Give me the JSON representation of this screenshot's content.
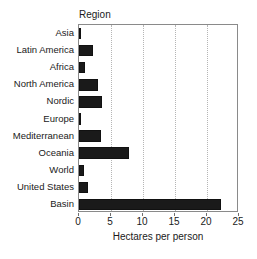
{
  "chart_data": {
    "type": "bar",
    "orientation": "horizontal",
    "title": "",
    "group_header": "Region",
    "xlabel": "Hectares per person",
    "ylabel": "",
    "xlim": [
      0,
      25
    ],
    "xticks": [
      0,
      5,
      10,
      15,
      20,
      25
    ],
    "xtick_labels": [
      "0",
      "5",
      "10",
      "15",
      "20",
      "25"
    ],
    "gridlines": [
      5,
      10,
      15,
      20
    ],
    "grid": true,
    "legend": null,
    "bar_color": "#1a1a1a",
    "categories": [
      "Asia",
      "Latin America",
      "Africa",
      "North America",
      "Nordic",
      "Europe",
      "Mediterranean",
      "Oceania",
      "World",
      "United States",
      "Basin"
    ],
    "values": [
      0.2,
      2.2,
      1.0,
      3.0,
      3.6,
      0.3,
      3.4,
      7.8,
      0.8,
      1.4,
      22.2
    ],
    "series": [
      {
        "name": "Hectares per person",
        "values": [
          0.2,
          2.2,
          1.0,
          3.0,
          3.6,
          0.3,
          3.4,
          7.8,
          0.8,
          1.4,
          22.2
        ]
      }
    ]
  }
}
